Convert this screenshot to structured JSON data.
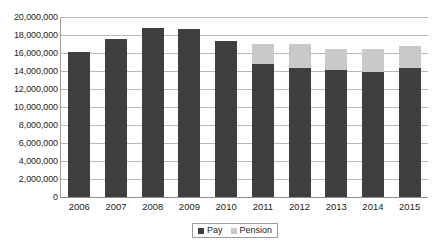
{
  "chart_data": {
    "type": "bar",
    "subtype": "stacked-column",
    "title": "",
    "xlabel": "",
    "ylabel": "",
    "categories": [
      "2006",
      "2007",
      "2008",
      "2009",
      "2010",
      "2011",
      "2012",
      "2013",
      "2014",
      "2015"
    ],
    "series": [
      {
        "name": "Pay",
        "color": "#3f3f3f",
        "values": [
          16100000,
          17600000,
          18800000,
          18700000,
          17300000,
          14800000,
          14300000,
          14100000,
          13900000,
          14300000
        ]
      },
      {
        "name": "Pension",
        "color": "#c9c9c9",
        "values": [
          0,
          0,
          0,
          0,
          0,
          2200000,
          2700000,
          2300000,
          2500000,
          2500000
        ]
      }
    ],
    "totals": [
      16100000,
      17600000,
      18800000,
      18700000,
      17300000,
      17000000,
      17000000,
      16400000,
      16400000,
      16800000
    ],
    "ylim": [
      0,
      20000000
    ],
    "ytick_values": [
      0,
      2000000,
      4000000,
      6000000,
      8000000,
      10000000,
      12000000,
      14000000,
      16000000,
      18000000,
      20000000
    ],
    "ytick_labels": [
      "0",
      "2,000,000",
      "4,000,000",
      "6,000,000",
      "8,000,000",
      "10,000,000",
      "12,000,000",
      "14,000,000",
      "16,000,000",
      "18,000,000",
      "20,000,000"
    ],
    "grid": true,
    "grid_axis": "y",
    "legend": {
      "position": "bottom",
      "entries": [
        {
          "label": "Pay",
          "color": "#3f3f3f"
        },
        {
          "label": "Pension",
          "color": "#c9c9c9"
        }
      ]
    }
  }
}
